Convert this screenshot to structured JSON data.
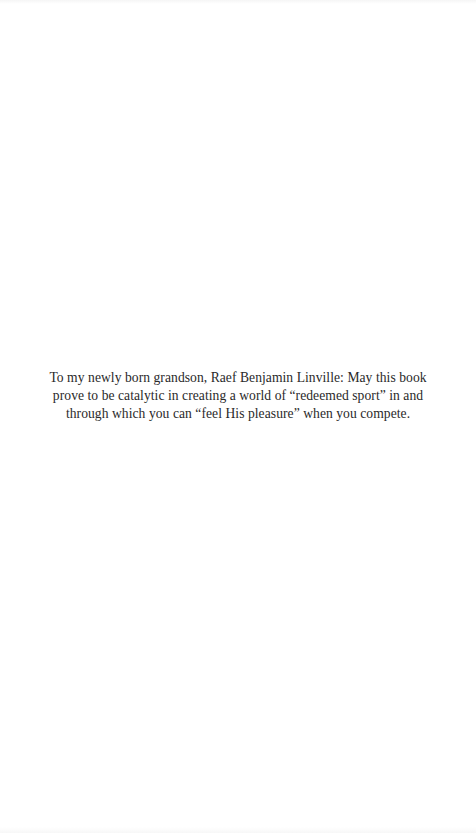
{
  "page": {
    "type": "dedication",
    "background_color": "#ffffff",
    "text_color": "#2a2a2a"
  },
  "dedication": {
    "lines": [
      "To my newly born grandson, Raef Benjamin Linville: May this book",
      "prove to be catalytic in creating a world of “redeemed sport” in and",
      "through which you can “feel His pleasure” when you compete."
    ]
  }
}
